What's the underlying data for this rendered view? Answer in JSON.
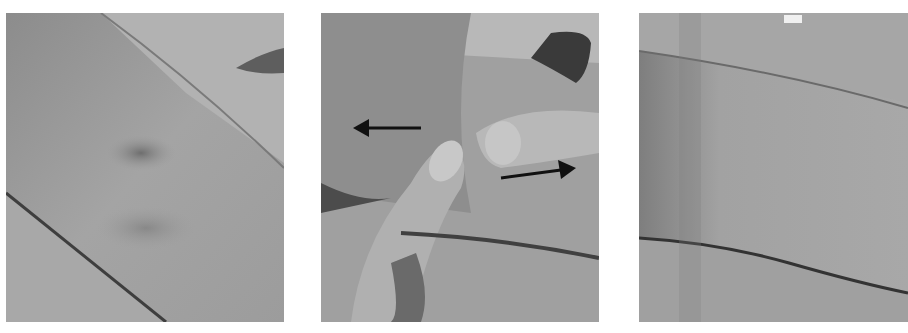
{
  "figure": {
    "panels": [
      {
        "id": "panel-1",
        "description": "Forearm skin with darker bruise-like patch near center"
      },
      {
        "id": "panel-2",
        "description": "Two fingers pressing skin apart, with arrows pointing left and right"
      },
      {
        "id": "panel-3",
        "description": "Forearm skin after stretching, lesion faded"
      }
    ],
    "arrows": [
      {
        "direction": "left"
      },
      {
        "direction": "right"
      }
    ],
    "colors": {
      "background": "#ffffff",
      "skin_light": "#b5b5b5",
      "skin_mid": "#9a9a9a",
      "skin_dark": "#6a6a6a",
      "arrow": "#111111"
    }
  }
}
